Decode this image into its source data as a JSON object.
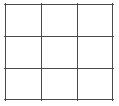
{
  "figure": {
    "kind": "grid-diagram",
    "canvas": {
      "width": 119,
      "height": 106,
      "background_color": "#ffffff"
    },
    "grid": {
      "rows": 3,
      "columns": 3,
      "cell_count": 9,
      "line_color": "#4a4a4a",
      "line_width": 1.6,
      "bounds": {
        "left": 5,
        "top": 4,
        "right": 113,
        "bottom": 100,
        "width": 108,
        "height": 96
      },
      "vertical_line_x": [
        5,
        41,
        77,
        113
      ],
      "horizontal_line_y": [
        4,
        36,
        68,
        100
      ],
      "cells": [
        {
          "id": "r1c1",
          "row": 1,
          "column": 1,
          "label": ""
        },
        {
          "id": "r1c2",
          "row": 1,
          "column": 2,
          "label": ""
        },
        {
          "id": "r1c3",
          "row": 1,
          "column": 3,
          "label": ""
        },
        {
          "id": "r2c1",
          "row": 2,
          "column": 1,
          "label": ""
        },
        {
          "id": "r2c2",
          "row": 2,
          "column": 2,
          "label": ""
        },
        {
          "id": "r2c3",
          "row": 2,
          "column": 3,
          "label": ""
        },
        {
          "id": "r3c1",
          "row": 3,
          "column": 1,
          "label": ""
        },
        {
          "id": "r3c2",
          "row": 3,
          "column": 2,
          "label": ""
        },
        {
          "id": "r3c3",
          "row": 3,
          "column": 3,
          "label": ""
        }
      ]
    }
  }
}
